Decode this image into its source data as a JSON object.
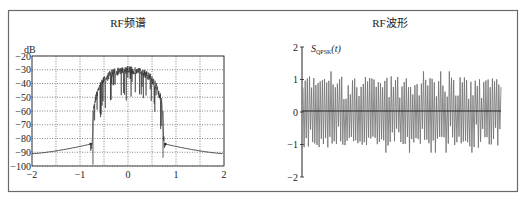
{
  "figure": {
    "frame_color": "#6a6a6a",
    "line_color": "#333333",
    "grid_color": "#444444",
    "waveform_color": "#6e6e6e"
  },
  "chart_data": [
    {
      "type": "line",
      "title": "RF频谱",
      "xlabel": "",
      "ylabel": "dB",
      "xlim": [
        -2,
        2
      ],
      "ylim": [
        -100,
        -20
      ],
      "grid": true,
      "grid_style": "dotted",
      "x_ticks": [
        -2,
        -1,
        0,
        1,
        2
      ],
      "x_tick_labels": [
        "−2",
        "−1",
        "0",
        "1",
        "2"
      ],
      "x_grid": [
        -2,
        -1.5,
        -1,
        -0.5,
        0,
        0.5,
        1,
        1.5,
        2
      ],
      "y_ticks": [
        -20,
        -30,
        -40,
        -50,
        -60,
        -70,
        -80,
        -90,
        -100
      ],
      "y_tick_labels": [
        "−20",
        "−30",
        "−40",
        "−50",
        "−60",
        "−70",
        "−80",
        "−90",
        "−100"
      ],
      "series": [
        {
          "name": "OPSK RF spectrum (envelope)",
          "x": [
            -2,
            -1.5,
            -1.0,
            -0.8,
            -0.76,
            -0.74,
            -0.72,
            -0.7,
            -0.65,
            -0.6,
            -0.5,
            -0.4,
            -0.3,
            -0.2,
            -0.1,
            0,
            0.1,
            0.2,
            0.3,
            0.4,
            0.5,
            0.6,
            0.65,
            0.7,
            0.72,
            0.74,
            0.76,
            0.8,
            1.0,
            1.5,
            2
          ],
          "y": [
            -91,
            -89,
            -86,
            -84,
            -83,
            -75,
            -60,
            -50,
            -45,
            -40,
            -35,
            -31,
            -29,
            -28,
            -28,
            -27,
            -28,
            -28,
            -29,
            -31,
            -34,
            -40,
            -45,
            -50,
            -60,
            -75,
            -83,
            -84,
            -86,
            -89,
            -91
          ]
        }
      ],
      "annotations": [
        "deep fading notches within passband down to about −55 dB",
        "markers at about (−0.78, −84) and (0.78, −84)"
      ]
    },
    {
      "type": "line",
      "title": "RF波形",
      "xlabel": "",
      "ylabel": "S_QPSK(t)",
      "ylabel_main": "S",
      "ylabel_sub": "QPSK",
      "ylabel_tail": "(t)",
      "ylim": [
        -2,
        2
      ],
      "grid": false,
      "y_ticks": [
        2,
        1,
        0,
        -1,
        -2
      ],
      "y_tick_labels": [
        "2",
        "1",
        "0",
        "−1",
        "−2"
      ],
      "series": [
        {
          "name": "QPSK RF waveform",
          "description": "high-frequency oscillation with amplitude roughly ±1, peaks up to about ±1.25",
          "amplitude": 1.0,
          "peak_max": 1.25,
          "peak_min": -1.25,
          "cycles": 92
        }
      ],
      "annotations": [
        "horizontal zero line"
      ]
    }
  ]
}
